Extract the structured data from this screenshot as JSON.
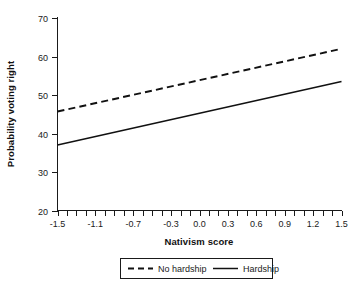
{
  "chart_data": {
    "type": "line",
    "title": "",
    "xlabel": "Nativism score",
    "ylabel": "Probability voting right",
    "xlim": [
      -1.5,
      1.5
    ],
    "ylim": [
      20,
      70
    ],
    "grid": false,
    "legend_position": "bottom-center",
    "x_tick_labels": [
      "-1.5",
      "-1.1",
      "-0.7",
      "-0.3",
      "0.0",
      "0.3",
      "0.6",
      "0.9",
      "1.2",
      "1.5"
    ],
    "x_tick_values": [
      -1.5,
      -1.1,
      -0.7,
      -0.3,
      0.0,
      0.3,
      0.6,
      0.9,
      1.2,
      1.5
    ],
    "x_minor_tick_step": 0.1,
    "y_tick_labels": [
      "20",
      "30",
      "40",
      "50",
      "60",
      "70"
    ],
    "y_tick_values": [
      20,
      30,
      40,
      50,
      60,
      70
    ],
    "x": [
      -1.5,
      1.5
    ],
    "series": [
      {
        "name": "No hardship",
        "style": "dashed",
        "color": "#111111",
        "values": [
          45.7,
          62.0
        ]
      },
      {
        "name": "Hardship",
        "style": "solid",
        "color": "#111111",
        "values": [
          37.0,
          53.5
        ]
      }
    ]
  },
  "legend": {
    "entries": [
      {
        "label": "No hardship",
        "style": "dashed"
      },
      {
        "label": "Hardship",
        "style": "solid"
      }
    ]
  },
  "colors": {
    "line": "#111111",
    "axis": "#1a1a1a",
    "background": "#ffffff"
  }
}
